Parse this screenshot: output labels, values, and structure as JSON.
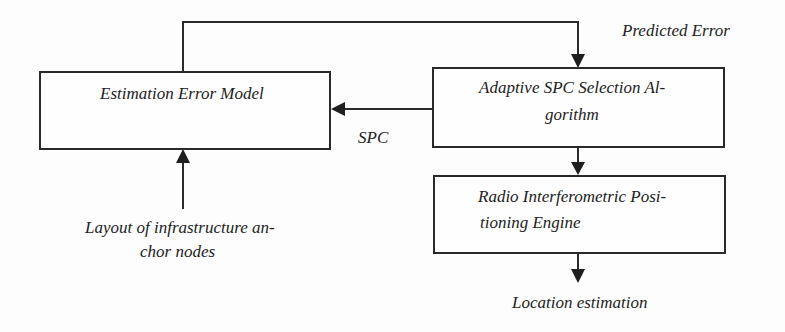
{
  "diagram": {
    "type": "flowchart",
    "boxes": [
      {
        "id": "estimation-error-model",
        "lines": [
          "Estimation Error Model"
        ]
      },
      {
        "id": "adaptive-spc-selection",
        "lines": [
          "Adaptive SPC Selection Al-",
          "gorithm"
        ]
      },
      {
        "id": "radio-interferometric-engine",
        "lines": [
          "Radio Interferometric Posi-",
          "tioning Engine"
        ]
      }
    ],
    "labels": {
      "predicted_error": "Predicted Error",
      "spc": "SPC",
      "layout_input": [
        "Layout of infrastructure an-",
        "chor nodes"
      ],
      "location_output": "Location estimation"
    },
    "edges": [
      {
        "from": "estimation-error-model",
        "to": "adaptive-spc-selection",
        "label": "Predicted Error"
      },
      {
        "from": "adaptive-spc-selection",
        "to": "estimation-error-model",
        "label": "SPC"
      },
      {
        "from": "layout-input",
        "to": "estimation-error-model"
      },
      {
        "from": "adaptive-spc-selection",
        "to": "radio-interferometric-engine"
      },
      {
        "from": "radio-interferometric-engine",
        "to": "location-output"
      }
    ],
    "colors": {
      "line": "#2a2a2a",
      "background": "#fdfdfd"
    }
  }
}
